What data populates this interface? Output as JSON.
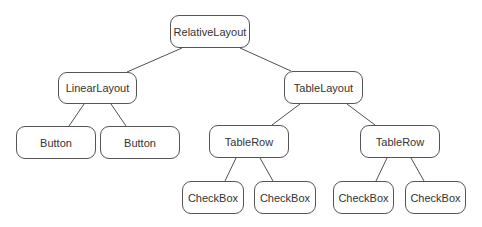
{
  "diagram": {
    "type": "tree",
    "title": "",
    "colors": {
      "stroke": "#555555",
      "text": "#333333",
      "fill": "#ffffff"
    },
    "nodes": [
      {
        "id": "relative",
        "label": "RelativeLayout",
        "x": 170,
        "y": 15,
        "w": 80,
        "h": 33
      },
      {
        "id": "linear",
        "label": "LinearLayout",
        "x": 58,
        "y": 72,
        "w": 79,
        "h": 32
      },
      {
        "id": "table",
        "label": "TableLayout",
        "x": 284,
        "y": 71,
        "w": 79,
        "h": 33
      },
      {
        "id": "button1",
        "label": "Button",
        "x": 16,
        "y": 126,
        "w": 80,
        "h": 33
      },
      {
        "id": "button2",
        "label": "Button",
        "x": 100,
        "y": 126,
        "w": 80,
        "h": 33
      },
      {
        "id": "row1",
        "label": "TableRow",
        "x": 209,
        "y": 125,
        "w": 80,
        "h": 33
      },
      {
        "id": "row2",
        "label": "TableRow",
        "x": 360,
        "y": 125,
        "w": 80,
        "h": 33
      },
      {
        "id": "check1",
        "label": "CheckBox",
        "x": 182,
        "y": 181,
        "w": 62,
        "h": 33
      },
      {
        "id": "check2",
        "label": "CheckBox",
        "x": 254,
        "y": 181,
        "w": 62,
        "h": 33
      },
      {
        "id": "check3",
        "label": "CheckBox",
        "x": 333,
        "y": 181,
        "w": 61,
        "h": 33
      },
      {
        "id": "check4",
        "label": "CheckBox",
        "x": 405,
        "y": 181,
        "w": 61,
        "h": 33
      }
    ],
    "edges": [
      {
        "from": "relative",
        "to": "linear",
        "x1": 182,
        "y1": 48,
        "x2": 127,
        "y2": 72
      },
      {
        "from": "relative",
        "to": "table",
        "x1": 240,
        "y1": 48,
        "x2": 291,
        "y2": 71
      },
      {
        "from": "linear",
        "to": "button1",
        "x1": 84,
        "y1": 104,
        "x2": 69,
        "y2": 126
      },
      {
        "from": "linear",
        "to": "button2",
        "x1": 111,
        "y1": 104,
        "x2": 126,
        "y2": 126
      },
      {
        "from": "table",
        "to": "row1",
        "x1": 300,
        "y1": 104,
        "x2": 272,
        "y2": 125
      },
      {
        "from": "table",
        "to": "row2",
        "x1": 347,
        "y1": 104,
        "x2": 375,
        "y2": 125
      },
      {
        "from": "row1",
        "to": "check1",
        "x1": 236,
        "y1": 158,
        "x2": 225,
        "y2": 181
      },
      {
        "from": "row1",
        "to": "check2",
        "x1": 260,
        "y1": 158,
        "x2": 273,
        "y2": 181
      },
      {
        "from": "row2",
        "to": "check3",
        "x1": 387,
        "y1": 158,
        "x2": 376,
        "y2": 181
      },
      {
        "from": "row2",
        "to": "check4",
        "x1": 411,
        "y1": 158,
        "x2": 424,
        "y2": 181
      }
    ]
  }
}
